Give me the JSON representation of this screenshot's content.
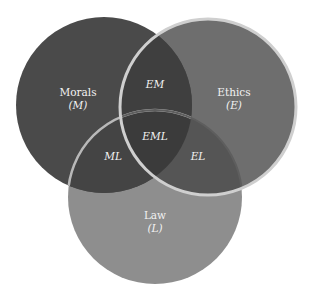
{
  "diagram": {
    "type": "venn",
    "sets": [
      {
        "id": "M",
        "name": "Morals",
        "symbol": "(M)",
        "color": "#4a4a4a"
      },
      {
        "id": "E",
        "name": "Ethics",
        "symbol": "(E)",
        "color": "#6e6e6e"
      },
      {
        "id": "L",
        "name": "Law",
        "symbol": "(L)",
        "color": "#8e8e8e"
      }
    ],
    "intersections": [
      {
        "id": "EM",
        "label": "EM",
        "color": "#3f3f3f"
      },
      {
        "id": "ML",
        "label": "ML",
        "color": "#444444"
      },
      {
        "id": "EL",
        "label": "EL",
        "color": "#555555"
      },
      {
        "id": "EML",
        "label": "EML",
        "color": "#3b3b3b"
      }
    ],
    "outline_color": "#cfcfcf"
  }
}
